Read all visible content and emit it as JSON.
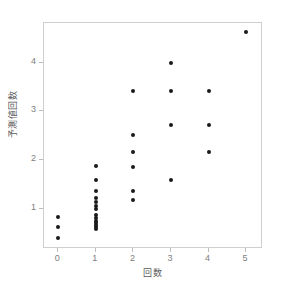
{
  "chart_data": {
    "type": "scatter",
    "title": "",
    "xlabel": "回数",
    "ylabel": "予測値回数",
    "xlim": [
      -0.38,
      5.45
    ],
    "ylim": [
      0.17,
      4.82
    ],
    "xticks": [
      0,
      1,
      2,
      3,
      4,
      5
    ],
    "xtick_labels": [
      "0",
      "1",
      "2",
      "3",
      "4",
      "5"
    ],
    "yticks": [
      1,
      2,
      3,
      4
    ],
    "ytick_labels": [
      "1",
      "2",
      "3",
      "4"
    ],
    "grid": false,
    "legend": null,
    "marker": {
      "shape": "circle",
      "color": "#1a1a1a",
      "size_px": 4
    },
    "frame_color": "#cfcfcf",
    "background": "#ffffff",
    "points": [
      {
        "x": 0,
        "y": 0.82
      },
      {
        "x": 0,
        "y": 0.63
      },
      {
        "x": 0,
        "y": 0.4
      },
      {
        "x": 1,
        "y": 1.87
      },
      {
        "x": 1,
        "y": 1.59
      },
      {
        "x": 1,
        "y": 1.36
      },
      {
        "x": 1,
        "y": 1.21
      },
      {
        "x": 1,
        "y": 1.14
      },
      {
        "x": 1,
        "y": 1.06
      },
      {
        "x": 1,
        "y": 0.99
      },
      {
        "x": 1,
        "y": 0.86
      },
      {
        "x": 1,
        "y": 0.8
      },
      {
        "x": 1,
        "y": 0.74
      },
      {
        "x": 1,
        "y": 0.7
      },
      {
        "x": 1,
        "y": 0.66
      },
      {
        "x": 1,
        "y": 0.62
      },
      {
        "x": 1,
        "y": 0.58
      },
      {
        "x": 2,
        "y": 3.43
      },
      {
        "x": 2,
        "y": 2.52
      },
      {
        "x": 2,
        "y": 2.16
      },
      {
        "x": 2,
        "y": 1.86
      },
      {
        "x": 2,
        "y": 1.36
      },
      {
        "x": 2,
        "y": 1.17
      },
      {
        "x": 3,
        "y": 4.0
      },
      {
        "x": 3,
        "y": 3.43
      },
      {
        "x": 3,
        "y": 2.72
      },
      {
        "x": 3,
        "y": 1.59
      },
      {
        "x": 4,
        "y": 3.43
      },
      {
        "x": 4,
        "y": 2.72
      },
      {
        "x": 4,
        "y": 2.16
      },
      {
        "x": 5,
        "y": 4.63
      }
    ]
  }
}
